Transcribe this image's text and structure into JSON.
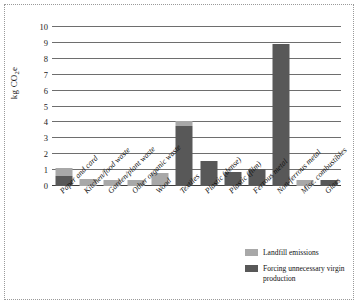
{
  "chart_data": {
    "type": "bar",
    "stacked": true,
    "title": "",
    "subtitle": "",
    "xlabel": "",
    "ylabel": "kg CO2e",
    "ylabel_rich": {
      "prefix": "kg CO",
      "sub": "2",
      "suffix": "e"
    },
    "ylim": [
      0,
      10
    ],
    "ytick_values": [
      0,
      1,
      2,
      3,
      4,
      5,
      6,
      7,
      8,
      9,
      10
    ],
    "ytick_labels": [
      "0",
      "1",
      "2",
      "3",
      "4",
      "5",
      "6",
      "7",
      "8",
      "9",
      "10"
    ],
    "grid": true,
    "grid_axis": "y",
    "legend_position": "bottom-right",
    "categories": [
      "Paper and card",
      "Kitchen/food waste",
      "Garden/plant waste",
      "Other organic waste",
      "Wood",
      "Textiles",
      "Plastic (dense)",
      "Plastic (film)",
      "Ferrous metal",
      "Non-ferrous metal",
      "Misc. combustibles",
      "Glass"
    ],
    "series": [
      {
        "name": "Forcing unnecessary virgin production",
        "color": "#585858",
        "values": [
          0.65,
          0.0,
          0.0,
          0.0,
          0.05,
          3.75,
          1.55,
          0.9,
          1.1,
          8.95,
          0.0,
          0.35
        ]
      },
      {
        "name": "Landfill emissions",
        "color": "#a8a8a8",
        "values": [
          0.5,
          0.45,
          0.35,
          0.35,
          0.75,
          0.35,
          0.0,
          0.0,
          0.0,
          0.0,
          0.35,
          0.0
        ]
      }
    ],
    "totals": [
      1.15,
      0.45,
      0.35,
      0.35,
      0.8,
      4.1,
      1.55,
      0.9,
      1.1,
      8.95,
      0.35,
      0.35
    ]
  },
  "legend": {
    "items": [
      {
        "label": "Landfill emissions",
        "swatch": "light"
      },
      {
        "label": "Forcing unnecessary virgin production",
        "swatch": "dark"
      }
    ]
  },
  "colors": {
    "landfill": "#a8a8a8",
    "virgin": "#585858",
    "gridline": "#6e6e6e",
    "axis": "#3d3d3d",
    "frame": "#9a9a9a",
    "background": "#ffffff"
  }
}
